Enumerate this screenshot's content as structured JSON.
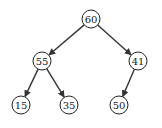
{
  "diagram": {
    "type": "binary-tree",
    "colors": {
      "stroke": "#222222",
      "fill": "#ffffff",
      "text": "#1a1a1a"
    },
    "nodes": [
      {
        "id": "n60",
        "label": "60",
        "x": 91,
        "y": 19
      },
      {
        "id": "n55",
        "label": "55",
        "x": 42,
        "y": 61
      },
      {
        "id": "n41",
        "label": "41",
        "x": 138,
        "y": 61
      },
      {
        "id": "n15",
        "label": "15",
        "x": 21,
        "y": 105
      },
      {
        "id": "n35",
        "label": "35",
        "x": 69,
        "y": 105
      },
      {
        "id": "n50",
        "label": "50",
        "x": 119,
        "y": 105
      }
    ],
    "edges": [
      {
        "from": "n60",
        "to": "n55"
      },
      {
        "from": "n60",
        "to": "n41"
      },
      {
        "from": "n55",
        "to": "n15"
      },
      {
        "from": "n55",
        "to": "n35"
      },
      {
        "from": "n41",
        "to": "n50"
      }
    ],
    "node_radius": 9
  }
}
